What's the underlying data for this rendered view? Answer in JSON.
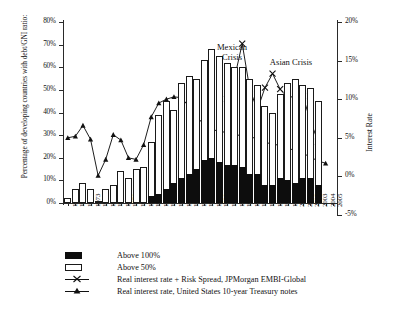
{
  "chart_data": {
    "type": "bar",
    "title": "",
    "xlabel": "",
    "ylabel": "Percentage of developing countries with debt/GNI ratio:",
    "y2label": "Interest Rate",
    "ylim": [
      0,
      80
    ],
    "y2lim": [
      -5,
      20
    ],
    "yticks": [
      "0%",
      "10%",
      "20%",
      "30%",
      "40%",
      "50%",
      "60%",
      "70%",
      "80%"
    ],
    "y2ticks": [
      "-5%",
      "0%",
      "5%",
      "10%",
      "15%",
      "20%"
    ],
    "grid": false,
    "legend_position": "below-axes",
    "categories": [
      "1970",
      "1971",
      "1972",
      "1973",
      "1974",
      "1975",
      "1976",
      "1977",
      "1978",
      "1979",
      "1980",
      "1981",
      "1982",
      "1983",
      "1984",
      "1985",
      "1986",
      "1987",
      "1988",
      "1989",
      "1990",
      "1991",
      "1992",
      "1993",
      "1994",
      "1995",
      "1996",
      "1997",
      "1998",
      "1999",
      "2000",
      "2001",
      "2002",
      "2003",
      "2004",
      "2005"
    ],
    "series": [
      {
        "name": "Above 50%",
        "type": "bar",
        "axis": "left",
        "color": "#ffffff",
        "edgecolor": "#1a1a1a",
        "values": [
          2,
          6,
          9,
          6,
          1,
          6,
          8,
          14,
          11,
          15,
          16,
          27,
          39,
          45,
          41,
          53,
          56,
          55,
          63,
          68,
          65,
          62,
          60,
          60,
          55,
          52,
          43,
          40,
          48,
          53,
          55,
          52,
          51,
          45,
          0,
          0
        ]
      },
      {
        "name": "Above 100%",
        "type": "bar",
        "axis": "left",
        "color": "#0d0d0d",
        "values": [
          0,
          0,
          0,
          0,
          0,
          0,
          0,
          0,
          0,
          0,
          0,
          3,
          4,
          6,
          9,
          11,
          13,
          15,
          19,
          20,
          18,
          17,
          17,
          16,
          13,
          13,
          8,
          8,
          11,
          10,
          9,
          11,
          11,
          8,
          0,
          0
        ]
      },
      {
        "name": "Real interest rate + Risk Spread, JPMorgan EMBI-Global",
        "type": "line",
        "marker": "x",
        "axis": "right",
        "color": "#111111",
        "x": [
          "1991",
          "1992",
          "1993",
          "1994",
          "1995",
          "1996",
          "1997",
          "1998",
          "1999",
          "2000",
          "2001",
          "2002",
          "2003"
        ],
        "values": [
          10.0,
          12.8,
          17.2,
          11.3,
          8.6,
          11.5,
          13.3,
          11.3,
          10.2,
          10.4,
          10.4,
          7.2,
          4.5
        ]
      },
      {
        "name": "Real interest rate, United States 10-year Treasury notes",
        "type": "line",
        "marker": "triangle",
        "axis": "right",
        "color": "#111111",
        "x": [
          "1970",
          "1971",
          "1972",
          "1973",
          "1974",
          "1975",
          "1976",
          "1977",
          "1978",
          "1979",
          "1980",
          "1981",
          "1982",
          "1983",
          "1984",
          "1985",
          "1986",
          "1987",
          "1988",
          "1989",
          "1990",
          "1991",
          "1992",
          "1993",
          "1994",
          "1995",
          "1996",
          "1997",
          "1998",
          "1999",
          "2000",
          "2001",
          "2002",
          "2003",
          "2004"
        ],
        "values": [
          5.0,
          5.2,
          6.6,
          4.8,
          0.1,
          2.2,
          5.4,
          4.7,
          2.4,
          2.2,
          4.1,
          7.7,
          9.5,
          10.0,
          10.3,
          10.2,
          9.0,
          7.8,
          6.6,
          6.2,
          5.7,
          5.8,
          5.8,
          4.9,
          5.4,
          4.6,
          4.4,
          4.2,
          4.0,
          3.4,
          3.6,
          3.0,
          2.5,
          2.0,
          1.7
        ]
      }
    ],
    "annotations": [
      {
        "text": "Mexican\nCrisis",
        "at_x": "1994"
      },
      {
        "text": "Asian Crisis",
        "at_x": "1997"
      }
    ]
  },
  "axes": {
    "y_left_title": "Percentage of developing countries with debt/GNI ratio:",
    "y_right_title": "Interest Rate",
    "y_left_ticks": [
      "80%",
      "70%",
      "60%",
      "50%",
      "40%",
      "30%",
      "20%",
      "10%",
      "0%"
    ],
    "y_right_ticks": [
      "20%",
      "15%",
      "10%",
      "5%",
      "0%",
      "-5%"
    ],
    "x_ticks": [
      "1970",
      "1971",
      "1972",
      "1973",
      "1974",
      "1975",
      "1976",
      "1977",
      "1978",
      "1979",
      "1980",
      "1981",
      "1982",
      "1983",
      "1984",
      "1985",
      "1986",
      "1987",
      "1988",
      "1989",
      "1990",
      "1991",
      "1992",
      "1993",
      "1994",
      "1995",
      "1996",
      "1997",
      "1998",
      "1999",
      "2000",
      "2001",
      "2002",
      "2003",
      "2004",
      "2005"
    ]
  },
  "annotations": {
    "mexican_crisis_line1": "Mexican",
    "mexican_crisis_line2": "Crisis",
    "asian_crisis": "Asian Crisis"
  },
  "legend": {
    "items": [
      {
        "label": "Above 100%",
        "key": "swatch-black"
      },
      {
        "label": "Above 50%",
        "key": "swatch-white"
      },
      {
        "label": "Real interest rate + Risk Spread, JPMorgan EMBI-Global",
        "key": "line-x"
      },
      {
        "label": "Real interest rate, United States 10-year Treasury notes",
        "key": "line-triangle"
      }
    ]
  }
}
